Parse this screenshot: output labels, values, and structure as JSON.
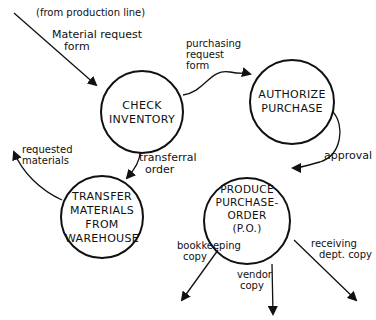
{
  "diagram": {
    "type": "data-flow",
    "nodes": [
      {
        "id": "check",
        "lines": [
          "CHECK",
          "INVENTORY"
        ]
      },
      {
        "id": "authorize",
        "lines": [
          "AUTHORIZE",
          "PURCHASE"
        ]
      },
      {
        "id": "transfer",
        "lines": [
          "TRANSFER",
          "MATERIALS",
          "FROM",
          "WAREHOUSE"
        ]
      },
      {
        "id": "produce",
        "lines": [
          "PRODUCE",
          "PURCHASE-",
          "ORDER",
          "(P.O.)"
        ]
      }
    ],
    "flows": [
      {
        "id": "source",
        "lines": [
          "(from production line)"
        ]
      },
      {
        "id": "material_request",
        "lines": [
          "Material request",
          "form"
        ]
      },
      {
        "id": "purchasing_request",
        "lines": [
          "purchasing",
          "request",
          "form"
        ]
      },
      {
        "id": "transferral",
        "lines": [
          "transferral",
          "order"
        ]
      },
      {
        "id": "requested",
        "lines": [
          "requested",
          "materials"
        ]
      },
      {
        "id": "approval",
        "lines": [
          "approval"
        ]
      },
      {
        "id": "bookkeeping",
        "lines": [
          "bookkeeping",
          "copy"
        ]
      },
      {
        "id": "vendor",
        "lines": [
          "vendor",
          "copy"
        ]
      },
      {
        "id": "receiving",
        "lines": [
          "receiving",
          "dept. copy"
        ]
      }
    ]
  }
}
